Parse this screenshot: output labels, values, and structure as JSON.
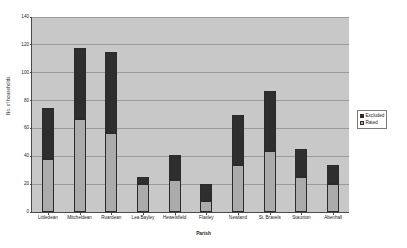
{
  "chart_data": {
    "type": "bar",
    "stacked": true,
    "title": "",
    "xlabel": "Parish",
    "ylabel": "No. of households",
    "ylim": [
      0,
      140
    ],
    "ytick_step": 20,
    "yticks": [
      0,
      20,
      40,
      60,
      80,
      100,
      120,
      140
    ],
    "grid": true,
    "legend_position": "right",
    "categories": [
      "Littledean",
      "Mitcheldean",
      "Ruardean",
      "Lea Bayley",
      "Hewelsfield",
      "Flaxley",
      "Newland",
      "St. Bravels",
      "Staunton",
      "Abenhall"
    ],
    "series": [
      {
        "name": "Rated",
        "color": "#ababab",
        "values": [
          38,
          67,
          57,
          20,
          23,
          8,
          34,
          44,
          25,
          20
        ]
      },
      {
        "name": "Excluded",
        "color": "#2e2e2e",
        "values": [
          37,
          51,
          58,
          5,
          18,
          12,
          36,
          43,
          20,
          14
        ]
      }
    ],
    "totals": [
      75,
      118,
      115,
      25,
      41,
      20,
      70,
      87,
      45,
      34
    ]
  },
  "legend": {
    "items": [
      {
        "label": "Excluded",
        "swatch": "excluded"
      },
      {
        "label": "Rated",
        "swatch": "rated"
      }
    ]
  },
  "colors": {
    "plot_background": "#c8c8c8",
    "gridline": "#9a9a9a",
    "axis": "#4a4a4a",
    "excluded": "#2e2e2e",
    "rated": "#ababab",
    "page_background": "#ffffff"
  }
}
